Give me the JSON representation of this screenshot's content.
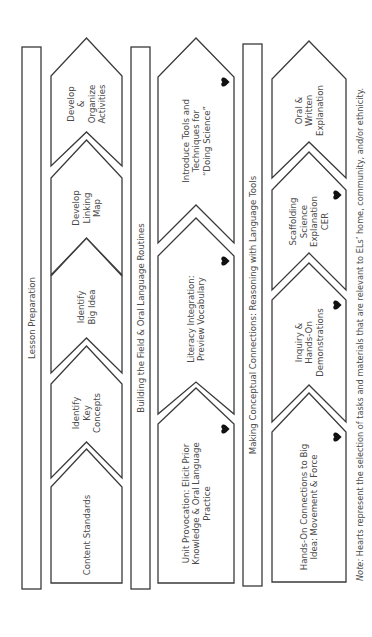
{
  "diagram": {
    "orientation": "rotated-90-ccw",
    "rows": [
      {
        "id": "lesson-preparation",
        "title": "Lesson Preparation",
        "bar": {
          "x": 22,
          "y": 47,
          "w": 19,
          "h": 542
        },
        "column": {
          "left": 51,
          "right": 122
        },
        "steps": [
          {
            "label": [
              "Content Standards"
            ],
            "heart": false,
            "apex": 449,
            "shoulder": 487,
            "bottom": 583,
            "notch": null
          },
          {
            "label": [
              "Identify",
              "Key",
              "Concepts"
            ],
            "heart": false,
            "apex": 346,
            "shoulder": 384,
            "bottom": 478,
            "notch": 442
          },
          {
            "label": [
              "Identify",
              "Big Idea"
            ],
            "heart": false,
            "apex": 238,
            "shoulder": 276,
            "bottom": 373,
            "notch": 338
          },
          {
            "label": [
              "Develop",
              "Linking",
              "Map"
            ],
            "heart": false,
            "apex": 140,
            "shoulder": 178,
            "bottom": 275,
            "notch": 238
          },
          {
            "label": [
              "Develop",
              "&",
              "Organize",
              "Activities"
            ],
            "heart": false,
            "apex": 38,
            "shoulder": 76,
            "bottom": 166,
            "notch": 132
          }
        ]
      },
      {
        "id": "building-the-field",
        "title": "Building the Field & Oral Language Routines",
        "bar": {
          "x": 131,
          "y": 47,
          "w": 19,
          "h": 542
        },
        "column": {
          "left": 158,
          "right": 234
        },
        "steps": [
          {
            "label": [
              "Unit Provocation: Elicit Prior",
              "Knowledge & Oral Language",
              "Practice"
            ],
            "heart": true,
            "apex": 388,
            "shoulder": 424,
            "bottom": 583,
            "notch": null
          },
          {
            "label": [
              "Literacy Integration:",
              "Preview Vocabulary"
            ],
            "heart": true,
            "apex": 218,
            "shoulder": 256,
            "bottom": 414,
            "notch": 382
          },
          {
            "label": [
              "Introduce Tools and",
              "Techniques for",
              "“Doing Science”"
            ],
            "heart": true,
            "apex": 38,
            "shoulder": 77,
            "bottom": 243,
            "notch": 205
          }
        ]
      },
      {
        "id": "making-conceptual-connections",
        "title": "Making Conceptual Connections: Reasoning with Language Tools",
        "bar": {
          "x": 243,
          "y": 44,
          "w": 19,
          "h": 542
        },
        "column": {
          "left": 272,
          "right": 346
        },
        "steps": [
          {
            "label": [
              "Hands-On Connections to Big",
              "Idea: Movement & Force"
            ],
            "heart": true,
            "apex": 393,
            "shoulder": 432,
            "bottom": 582,
            "notch": null
          },
          {
            "label": [
              "Inquiry &",
              "Hands-On",
              "Demonstrations"
            ],
            "heart": true,
            "apex": 263,
            "shoulder": 300,
            "bottom": 422,
            "notch": 385
          },
          {
            "label": [
              "Scaffolding",
              "Science",
              "Explanation",
              "CER"
            ],
            "heart": true,
            "apex": 152,
            "shoulder": 190,
            "bottom": 290,
            "notch": 253
          },
          {
            "label": [
              "Oral &",
              "Written",
              "Explanation"
            ],
            "heart": false,
            "apex": 41,
            "shoulder": 79,
            "bottom": 178,
            "notch": 142
          }
        ]
      }
    ],
    "note": {
      "prefix": "Note:",
      "text": " Hearts represent the selection of tasks and materials that are relevant to ELs’ home, community, and/or ethnicity.",
      "x": 363,
      "y": 581
    },
    "colors": {
      "stroke": "#3a3a3a",
      "text": "#4a4a4a",
      "heart": "#111111",
      "background": "#ffffff"
    },
    "icons": {
      "heart": "heart-icon"
    }
  }
}
